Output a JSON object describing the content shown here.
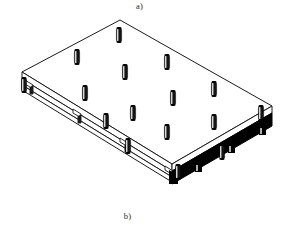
{
  "figure": {
    "label_top": "a)",
    "label_bottom": "b)",
    "caption_style": "subfigure-letters",
    "background_color": "#ffffff",
    "line_color": "#1a1a1a",
    "highlight_color": "#000000",
    "fill_color": "#ffffff",
    "title_alt": "Isometric view of a rectangular base plate fixture with vertical locating pins"
  },
  "drawing": {
    "type": "isometric-technical-illustration",
    "subject": "rectangular pallet base plate with locating pin grid",
    "plate": {
      "corner_left": {
        "x": 22,
        "y": 72
      },
      "corner_top": {
        "x": 120,
        "y": 20
      },
      "corner_right": {
        "x": 272,
        "y": 106
      },
      "corner_bottom": {
        "x": 172,
        "y": 172
      },
      "thickness_px": 7,
      "top_face_fill": "#ffffff",
      "edge_stroke_width": 1.0
    },
    "beams": [
      {
        "name": "front-left-beam",
        "style": "outline",
        "from": {
          "x": 22,
          "y": 79
        },
        "to": {
          "x": 172,
          "y": 172
        },
        "tabs": 3,
        "fill": "#ffffff",
        "stroke": "#1a1a1a"
      },
      {
        "name": "front-right-beam-highlighted",
        "style": "solid-black",
        "from": {
          "x": 172,
          "y": 172
        },
        "to": {
          "x": 272,
          "y": 113
        },
        "tabs": 3,
        "fill": "#000000",
        "stroke": "#000000",
        "note": "emphasised edge member"
      }
    ],
    "pin": {
      "shape": "cylinder",
      "width_px": 5,
      "height_px": 15,
      "body_color": "#151515",
      "highlight_color": "#ffffff",
      "cap_color": "#000000",
      "count": 16
    },
    "pins": [
      {
        "id": "p-back-left-corner",
        "x": 24,
        "y": 71,
        "row": "back-left-edge",
        "col": 0
      },
      {
        "id": "p-back-left-mid",
        "x": 77,
        "y": 43,
        "row": "back-left-edge",
        "col": 1
      },
      {
        "id": "p-back-apex",
        "x": 119,
        "y": 21,
        "row": "back-apex",
        "col": 2
      },
      {
        "id": "p-back-right-mid",
        "x": 167,
        "y": 48,
        "row": "back-right-edge",
        "col": 3
      },
      {
        "id": "p-back-right-far",
        "x": 214,
        "y": 75,
        "row": "back-right-edge",
        "col": 4
      },
      {
        "id": "p-right-corner",
        "x": 261,
        "y": 99,
        "row": "right-corner",
        "col": 5
      },
      {
        "id": "p-inner-r1-c1",
        "x": 85,
        "y": 79,
        "row": "inner-1",
        "col": 1
      },
      {
        "id": "p-inner-r1-c2",
        "x": 125,
        "y": 58,
        "row": "inner-1",
        "col": 2
      },
      {
        "id": "p-inner-r1-c3",
        "x": 173,
        "y": 84,
        "row": "inner-1",
        "col": 3
      },
      {
        "id": "p-inner-r1-c4",
        "x": 214,
        "y": 108,
        "row": "inner-1",
        "col": 4
      },
      {
        "id": "p-inner-r2-c1",
        "x": 106,
        "y": 107,
        "row": "inner-2",
        "col": 1
      },
      {
        "id": "p-inner-r2-c2",
        "x": 133,
        "y": 99,
        "row": "inner-2",
        "col": 2
      },
      {
        "id": "p-inner-r2-c3",
        "x": 167,
        "y": 118,
        "row": "inner-2",
        "col": 3
      },
      {
        "id": "p-inner-r2-c4",
        "x": 222,
        "y": 138,
        "row": "inner-2",
        "col": 4
      },
      {
        "id": "p-inner-r3-c1",
        "x": 128,
        "y": 132,
        "row": "inner-3",
        "col": 1
      },
      {
        "id": "p-inner-r3-c2",
        "x": 178,
        "y": 158,
        "row": "inner-3",
        "col": 3
      }
    ]
  }
}
